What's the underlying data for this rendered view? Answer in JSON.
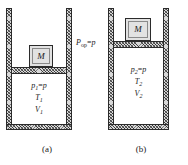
{
  "figure": {
    "kind": "thermodynamics-piston-cylinder-diagram"
  },
  "panels": [
    {
      "id": "a",
      "caption": "(a)",
      "weight_label": "M",
      "state": {
        "pressure": "p",
        "pressure_symbol": "p",
        "pressure_subscript": "1",
        "pressure_equation": "p₁ = p",
        "temperature_symbol": "T",
        "temperature_subscript": "1",
        "volume_symbol": "V",
        "volume_subscript": "1"
      }
    },
    {
      "id": "b",
      "caption": "(b)",
      "weight_label": "M",
      "state": {
        "pressure": "p",
        "pressure_symbol": "p",
        "pressure_subscript": "2",
        "pressure_equation": "p₂ = p",
        "temperature_symbol": "T",
        "temperature_subscript": "2",
        "volume_symbol": "V",
        "volume_subscript": "2"
      }
    }
  ],
  "annotations": {
    "external_pressure": {
      "symbol": "P",
      "subscript": "op",
      "equals": "=",
      "value": "p",
      "full_text": "P_op = p"
    }
  },
  "colors": {
    "ink": "#1a1a1a",
    "wall_fill": "#d8d8d8",
    "wall_stroke": "#2b2b2b",
    "weight_fill": "#e2e2e2",
    "gas_fill": "#ffffff",
    "background": "#ffffff"
  }
}
